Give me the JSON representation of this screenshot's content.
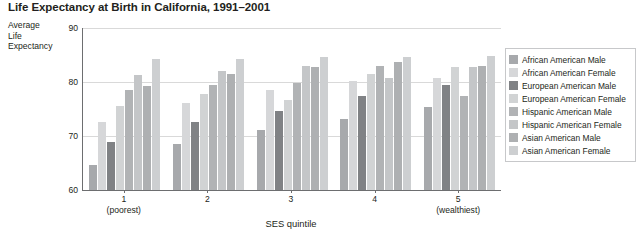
{
  "chart_data": {
    "type": "bar",
    "title": "Life Expectancy at Birth in California, 1991–2001",
    "ylabel": "Average Life Expectancy",
    "xlabel": "SES quintile",
    "ylim": [
      60,
      90
    ],
    "yticks": [
      60,
      70,
      80,
      90
    ],
    "grid": true,
    "legend_position": "right",
    "categories": [
      "1",
      "2",
      "3",
      "4",
      "5"
    ],
    "category_sublabels": [
      "(poorest)",
      "",
      "",
      "",
      "(wealthiest)"
    ],
    "series": [
      {
        "name": "African American Male",
        "color": "#a7a9ac",
        "values": [
          64.7,
          68.6,
          71.2,
          73.2,
          75.3
        ]
      },
      {
        "name": "African American Female",
        "color": "#d6d7d9",
        "values": [
          72.6,
          76.1,
          78.5,
          80.1,
          80.8
        ]
      },
      {
        "name": "European American Male",
        "color": "#808285",
        "values": [
          68.9,
          72.6,
          74.6,
          77.5,
          79.4
        ]
      },
      {
        "name": "European American Female",
        "color": "#d1d3d4",
        "values": [
          75.5,
          77.8,
          76.6,
          81.5,
          82.7
        ]
      },
      {
        "name": "Hispanic American Male",
        "color": "#b1b3b5",
        "values": [
          78.6,
          79.5,
          79.8,
          83.0,
          77.4
        ]
      },
      {
        "name": "Hispanic American Female",
        "color": "#c4c6c8",
        "values": [
          81.3,
          82.0,
          83.0,
          80.7,
          82.8
        ]
      },
      {
        "name": "Asian American Male",
        "color": "#aeb0b2",
        "values": [
          79.3,
          81.4,
          82.7,
          83.7,
          83.0
        ]
      },
      {
        "name": "Asian American Female",
        "color": "#cdcfd1",
        "values": [
          84.3,
          84.3,
          84.6,
          84.7,
          84.9
        ]
      }
    ]
  },
  "y_caption_lines": [
    "Average",
    "Life",
    "Expectancy"
  ]
}
